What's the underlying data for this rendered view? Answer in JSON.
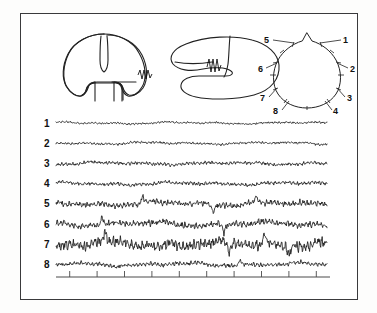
{
  "figure": {
    "title": "",
    "background_color": "#ffffff",
    "border_color": "#3a3a3c",
    "ink_color": "#1a1a1a"
  },
  "panels": {
    "coronal_section": {
      "name": "coronal-brain-section",
      "marker": "emg-squiggle"
    },
    "horizontal_section": {
      "name": "horizontal-brain-section",
      "marker": "emg-squiggle"
    },
    "head_map": {
      "name": "head-electrode-map",
      "electrodes": [
        {
          "label": "1",
          "side": "right-frontal"
        },
        {
          "label": "2",
          "side": "right-anterior-temporal"
        },
        {
          "label": "3",
          "side": "right-posterior-temporal"
        },
        {
          "label": "4",
          "side": "right-occipital"
        },
        {
          "label": "5",
          "side": "left-frontal"
        },
        {
          "label": "6",
          "side": "left-anterior-temporal"
        },
        {
          "label": "7",
          "side": "left-posterior-temporal"
        },
        {
          "label": "8",
          "side": "left-occipital"
        }
      ]
    }
  },
  "traces": {
    "name": "eeg-trace-stack",
    "channels": [
      {
        "label": "1",
        "amplitude": 1.5,
        "roughness": 0.9,
        "spikes": []
      },
      {
        "label": "2",
        "amplitude": 1.7,
        "roughness": 1.0,
        "spikes": []
      },
      {
        "label": "3",
        "amplitude": 2.0,
        "roughness": 1.2,
        "spikes": []
      },
      {
        "label": "4",
        "amplitude": 2.2,
        "roughness": 1.2,
        "spikes": []
      },
      {
        "label": "5",
        "amplitude": 3.0,
        "roughness": 1.4,
        "spikes": [
          0.32,
          0.58,
          0.74
        ]
      },
      {
        "label": "6",
        "amplitude": 3.2,
        "roughness": 1.5,
        "spikes": [
          0.17,
          0.62
        ]
      },
      {
        "label": "7",
        "amplitude": 4.2,
        "roughness": 1.8,
        "spikes": [
          0.18,
          0.64,
          0.77,
          0.86
        ]
      },
      {
        "label": "8",
        "amplitude": 2.4,
        "roughness": 1.3,
        "spikes": [
          0.68
        ]
      }
    ]
  },
  "scale_bar": {
    "name": "time-scale-bar",
    "tick_count": 10,
    "label": ""
  }
}
